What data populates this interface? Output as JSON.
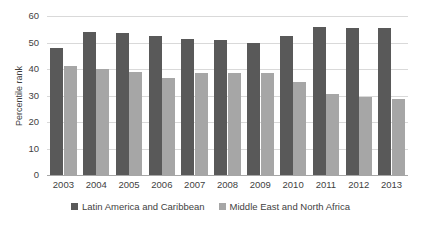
{
  "chart_data": {
    "type": "bar",
    "title": "",
    "xlabel": "",
    "ylabel": "Percentile rank",
    "ylim": [
      0,
      60
    ],
    "yticks": [
      0,
      10,
      20,
      30,
      40,
      50,
      60
    ],
    "grid": true,
    "legend_position": "bottom",
    "categories": [
      "2003",
      "2004",
      "2005",
      "2006",
      "2007",
      "2008",
      "2009",
      "2010",
      "2011",
      "2012",
      "2013"
    ],
    "series": [
      {
        "name": "Latin America and Caribbean",
        "color": "#595959",
        "values": [
          48,
          54,
          53.5,
          52.5,
          51.5,
          51,
          50,
          52.5,
          56,
          55.5,
          55.5
        ]
      },
      {
        "name": "Middle East and North Africa",
        "color": "#a6a6a6",
        "values": [
          41,
          40,
          39,
          36.5,
          38.5,
          38.5,
          38.5,
          35,
          30.5,
          29.5,
          28.5
        ]
      }
    ]
  }
}
